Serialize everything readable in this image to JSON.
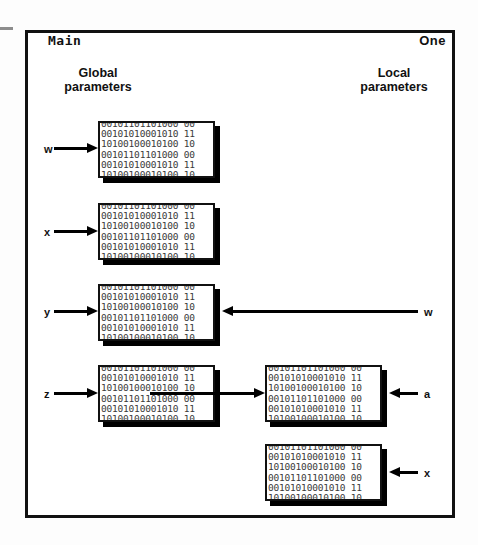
{
  "diagram": {
    "title_left": "Main",
    "title_right": "One",
    "subtitle_left": "Global\nparameters",
    "subtitle_left_line1": "Global",
    "subtitle_left_line2": "parameters",
    "subtitle_right_line1": "Local",
    "subtitle_right_line2": "parameters",
    "bit_pattern_lines": [
      "00101101101000 00",
      "00101010001010 11",
      "10100100010100 10"
    ],
    "bit_block_text": "00101101101000 00\n00101010001010 11\n10100100010100 10\n00101101101000 00\n00101010001010 11\n10100100010100 10",
    "colors": {
      "frame": "#111111",
      "block_border": "#111111",
      "block_shadow": "#000000",
      "bits": "#3a3a3a",
      "arrow": "#000000",
      "corner_tick": "#8d8d8d"
    },
    "left_column": {
      "label": "Global parameters",
      "rows": [
        {
          "name": "w",
          "arrow": "right"
        },
        {
          "name": "x",
          "arrow": "right"
        },
        {
          "name": "y",
          "arrow": "right"
        },
        {
          "name": "z",
          "arrow": "right"
        }
      ]
    },
    "right_column": {
      "label": "Local parameters",
      "rows": [
        {
          "name": "w",
          "arrow": "left",
          "targets": "y-block"
        },
        {
          "name": "a",
          "arrow": "left",
          "targets": "a-block"
        },
        {
          "name": "x",
          "arrow": "left",
          "targets": "x-block"
        }
      ]
    },
    "link_arrow": {
      "from": "z-block",
      "to": "a-block",
      "direction": "right"
    }
  }
}
